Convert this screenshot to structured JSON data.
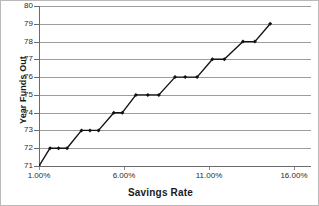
{
  "chart_data": {
    "type": "line",
    "title": "",
    "xlabel": "Savings Rate",
    "ylabel": "Year Funds Out",
    "xlim": [
      1.0,
      17.0
    ],
    "ylim": [
      71,
      80
    ],
    "grid": true,
    "legend": false,
    "marker": "filled-diamond",
    "line_color": "#121212",
    "grid_color": "#9d9d9d",
    "y_ticks": [
      80,
      79,
      78,
      77,
      76,
      75,
      74,
      73,
      72,
      71
    ],
    "y_tick_labels": [
      "80",
      "79",
      "78",
      "77",
      "76",
      "75",
      "74",
      "73",
      "72",
      "71"
    ],
    "x_ticks": [
      1.0,
      6.0,
      11.0,
      16.0
    ],
    "x_tick_labels": [
      "1.00%",
      "6.00%",
      "11.00%",
      "16.00%"
    ],
    "x": [
      1.0,
      1.5,
      2.0,
      2.5,
      3.0,
      3.5,
      4.0,
      4.5,
      5.0,
      5.5,
      6.0,
      6.5,
      7.0,
      7.5,
      8.0,
      8.5,
      9.0,
      9.5,
      10.0,
      10.5,
      11.0,
      11.5,
      12.0,
      12.5,
      13.0,
      13.5,
      14.0,
      14.5,
      15.0,
      15.5,
      16.0,
      16.5,
      17.0
    ],
    "values": [
      71,
      72,
      72,
      72,
      73,
      73,
      73,
      74,
      74,
      75,
      75,
      75,
      76,
      76,
      76,
      77,
      77,
      78,
      78,
      79,
      79,
      79,
      79,
      79,
      79,
      79,
      79,
      79,
      79,
      79,
      79,
      79,
      79
    ],
    "points": [
      {
        "x": 1.0,
        "y": 71
      },
      {
        "x": 1.65,
        "y": 72
      },
      {
        "x": 2.15,
        "y": 72
      },
      {
        "x": 2.65,
        "y": 72
      },
      {
        "x": 3.5,
        "y": 73
      },
      {
        "x": 4.0,
        "y": 73
      },
      {
        "x": 4.5,
        "y": 73
      },
      {
        "x": 5.4,
        "y": 74
      },
      {
        "x": 5.9,
        "y": 74
      },
      {
        "x": 6.7,
        "y": 75
      },
      {
        "x": 7.4,
        "y": 75
      },
      {
        "x": 8.05,
        "y": 75
      },
      {
        "x": 9.0,
        "y": 76
      },
      {
        "x": 9.6,
        "y": 76
      },
      {
        "x": 10.3,
        "y": 76
      },
      {
        "x": 11.2,
        "y": 77
      },
      {
        "x": 11.9,
        "y": 77
      },
      {
        "x": 13.0,
        "y": 78
      },
      {
        "x": 13.7,
        "y": 78
      },
      {
        "x": 14.6,
        "y": 79
      }
    ]
  }
}
